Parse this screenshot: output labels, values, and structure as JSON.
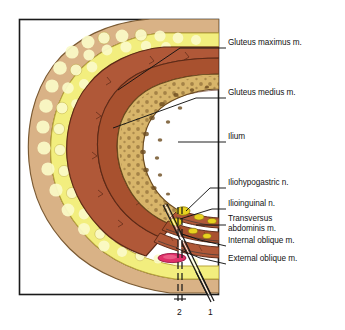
{
  "figure": {
    "frame": {
      "color": "#1a1a1a"
    },
    "background": "#ffffff"
  },
  "palette": {
    "skin": "#d9b286",
    "skin_outline": "#7a5a33",
    "fat": "#f2ee7e",
    "fat_highlight": "#fbfbc8",
    "fat_outline": "#b9a53a",
    "muscle": "#b05838",
    "muscle_dark": "#8d3f25",
    "muscle_outline": "#5d2a17",
    "bone": "#d8b56a",
    "bone_marrow": "#6b4a1e",
    "bone_outline": "#6b4a1e",
    "nerve": "#e8d21f",
    "anesthetic": "#e0306a",
    "needle": "#1a1a1a",
    "leader": "#131313",
    "text": "#131313"
  },
  "labels": [
    {
      "id": "gluteus-maximus",
      "text": "Gluteus maximus m.",
      "x": 228,
      "y": 43,
      "leader": [
        [
          226,
          48
        ],
        [
          180,
          48
        ],
        [
          118,
          90
        ]
      ]
    },
    {
      "id": "gluteus-medius",
      "text": "Gluteus medius m.",
      "x": 228,
      "y": 93,
      "leader": [
        [
          226,
          98
        ],
        [
          196,
          98
        ],
        [
          113,
          128
        ]
      ]
    },
    {
      "id": "ilium",
      "text": "Ilium",
      "x": 228,
      "y": 138,
      "leader": [
        [
          226,
          142
        ],
        [
          178,
          142
        ]
      ]
    },
    {
      "id": "iliohypogastric-nerve",
      "text": "Iliohypogastric n.",
      "x": 228,
      "y": 184,
      "leader": [
        [
          226,
          188
        ],
        [
          210,
          188
        ],
        [
          186,
          211
        ]
      ]
    },
    {
      "id": "ilioinguinal-nerve",
      "text": "Ilioinguinal n.",
      "x": 228,
      "y": 205,
      "leader": [
        [
          226,
          209
        ],
        [
          212,
          209
        ],
        [
          180,
          219
        ]
      ]
    },
    {
      "id": "transversus-abdominis",
      "text": "Transversus\nabdominis m.",
      "x": 228,
      "y": 219,
      "leader": [
        [
          226,
          225
        ],
        [
          196,
          225
        ]
      ]
    },
    {
      "id": "internal-oblique",
      "text": "Internal oblique m.",
      "x": 228,
      "y": 242,
      "leader": [
        [
          226,
          246
        ],
        [
          198,
          240
        ],
        [
          182,
          235
        ]
      ]
    },
    {
      "id": "external-oblique",
      "text": "External oblique m.",
      "x": 228,
      "y": 261,
      "leader": [
        [
          226,
          264
        ],
        [
          200,
          258
        ],
        [
          176,
          248
        ]
      ]
    }
  ],
  "needle_markers": [
    {
      "id": "needle-2",
      "text": "2",
      "x": 180,
      "y": 311,
      "style": "dashed-vertical"
    },
    {
      "id": "needle-1",
      "text": "1",
      "x": 210,
      "y": 311,
      "style": "solid-angled"
    }
  ],
  "structures": [
    {
      "name": "skin"
    },
    {
      "name": "subcutaneous-fat"
    },
    {
      "name": "gluteus-maximus-muscle"
    },
    {
      "name": "gluteus-medius-muscle"
    },
    {
      "name": "ilium-bone"
    },
    {
      "name": "transversus-abdominis-muscle"
    },
    {
      "name": "internal-oblique-muscle"
    },
    {
      "name": "external-oblique-muscle"
    },
    {
      "name": "iliohypogastric-nerve-bundle"
    },
    {
      "name": "ilioinguinal-nerve-bundle"
    },
    {
      "name": "anesthetic-deposit"
    }
  ]
}
